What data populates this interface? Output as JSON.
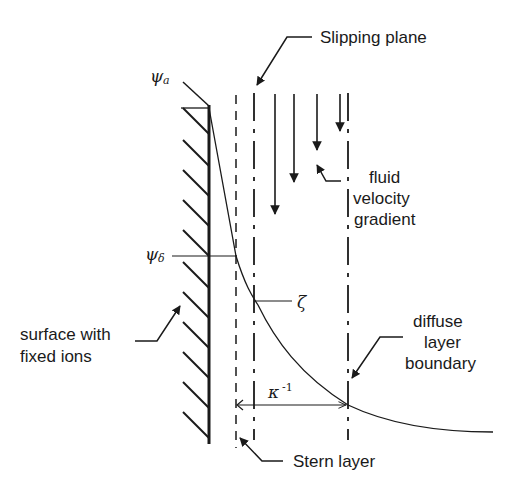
{
  "diagram": {
    "labels": {
      "slipping_plane": "Slipping plane",
      "fluid_velocity_gradient": [
        "fluid",
        "velocity",
        "gradient"
      ],
      "surface_with_fixed_ions": [
        "surface with",
        "fixed ions"
      ],
      "diffuse_layer_boundary": [
        "diffuse",
        "layer",
        "boundary"
      ],
      "stern_layer": "Stern layer"
    },
    "symbols": {
      "psi": "ψ",
      "psi_a_sub": "a",
      "psi_delta_sub": "δ",
      "zeta": "ζ",
      "kappa": "κ",
      "kappa_exp": "-1"
    },
    "colors": {
      "ink": "#1a1a1a",
      "background": "#ffffff"
    }
  }
}
